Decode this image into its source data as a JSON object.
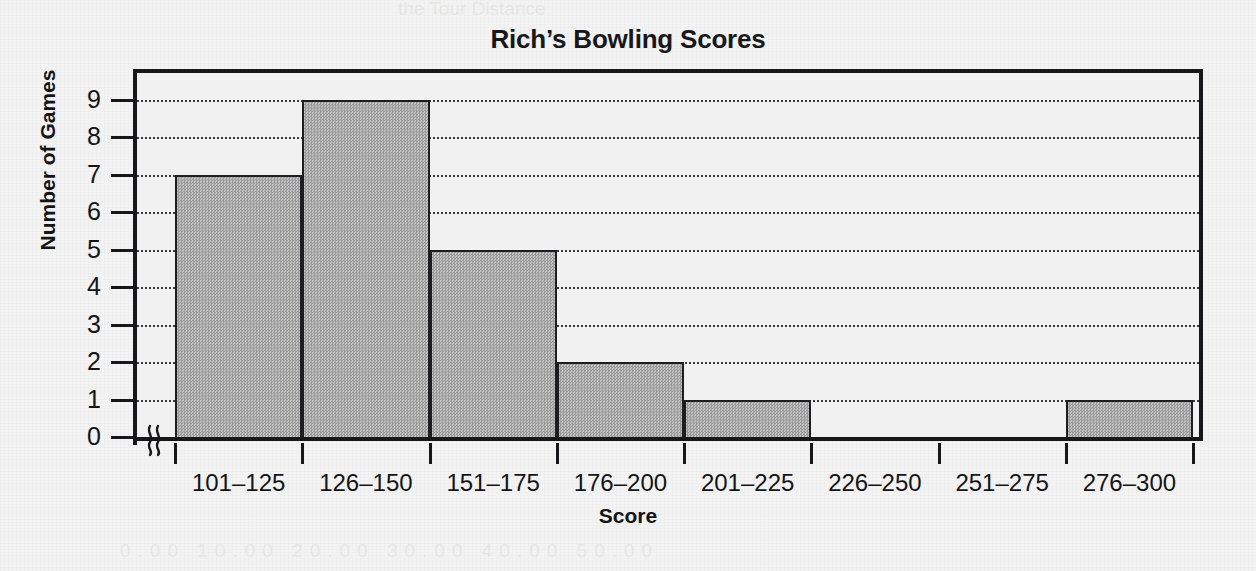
{
  "chart_data": {
    "type": "bar",
    "title": "Rich’s Bowling Scores",
    "xlabel": "Score",
    "ylabel": "Number of Games",
    "categories": [
      "101–125",
      "126–150",
      "151–175",
      "176–200",
      "201–225",
      "226–250",
      "251–275",
      "276–300"
    ],
    "values": [
      7,
      9,
      5,
      2,
      1,
      0,
      0,
      1
    ],
    "ylim": [
      0,
      9
    ],
    "y_ticks": [
      "0",
      "1",
      "2",
      "3",
      "4",
      "5",
      "6",
      "7",
      "8",
      "9"
    ],
    "grid": true,
    "grid_style": "dotted-horizontal",
    "legend": "none",
    "axis_break": true,
    "axis_break_symbol": "≈",
    "bar_fill_color": "#a9a9a9",
    "bar_edge_color": "#1d1d20",
    "frame_color": "#17171a",
    "plot_background": "#f1f1f1",
    "page_background": "#f3f3f3"
  },
  "figure": {
    "title": "Rich’s Bowling Scores",
    "x_axis_title": "Score",
    "y_axis_title": "Number of Games"
  },
  "bleed_through": {
    "top": "the Tour Distance",
    "bottom": "0.00 10.00 20.00 30.00 40.00 50.00"
  }
}
